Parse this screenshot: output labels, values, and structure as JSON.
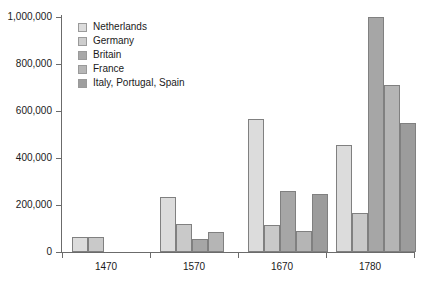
{
  "chart_data": {
    "type": "bar",
    "title": "",
    "subtitle": "",
    "xlabel": "",
    "ylabel": "",
    "grid": false,
    "legend_position": "top-left-inside",
    "categories": [
      "1470",
      "1570",
      "1670",
      "1780"
    ],
    "ylim": [
      0,
      1000000
    ],
    "ytick_values": [
      0,
      200000,
      400000,
      600000,
      800000,
      1000000
    ],
    "ytick_labels": [
      "0",
      "200,000",
      "400,000",
      "600,000",
      "800,000",
      "1,000,000"
    ],
    "series": [
      {
        "name": "Netherlands",
        "color": "#dcdcdc",
        "values": [
          65000,
          235000,
          568000,
          455000
        ]
      },
      {
        "name": "Germany",
        "color": "#c9c9c9",
        "values": [
          65000,
          120000,
          115000,
          165000
        ]
      },
      {
        "name": "Britain",
        "color": "#a6a6a6",
        "values": [
          null,
          55000,
          260000,
          1000000
        ]
      },
      {
        "name": "France",
        "color": "#b5b5b5",
        "values": [
          null,
          85000,
          88000,
          710000
        ]
      },
      {
        "name": "Italy, Portugal, Spain",
        "color": "#9c9c9c",
        "values": [
          null,
          null,
          248000,
          550000
        ]
      }
    ]
  },
  "legend": {
    "items": [
      {
        "label": "Netherlands",
        "color": "#dcdcdc"
      },
      {
        "label": "Germany",
        "color": "#cdcdcd"
      },
      {
        "label": "Britain",
        "color": "#a8a8a8"
      },
      {
        "label": "France",
        "color": "#b6b6b6"
      },
      {
        "label": "Italy, Portugal, Spain",
        "color": "#9e9e9e"
      }
    ]
  },
  "axes": {
    "y_labels": [
      "1,000,000",
      "800,000",
      "600,000",
      "400,000",
      "200,000",
      "0"
    ],
    "x_labels": [
      "1470",
      "1570",
      "1670",
      "1780"
    ]
  },
  "colors": {
    "axis": "#6b6b6b",
    "bar_border": "#808080",
    "text": "#1a1a1a",
    "background": "#ffffff"
  }
}
